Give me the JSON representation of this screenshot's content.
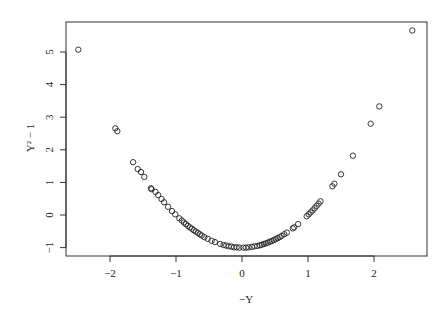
{
  "chart_data": {
    "type": "scatter",
    "title": "",
    "xlabel": "−Y",
    "ylabel": "Y² − 1",
    "xlim": [
      -2.65,
      2.8
    ],
    "ylim": [
      -1.25,
      5.95
    ],
    "xticks": [
      -2,
      -1,
      0,
      1,
      2
    ],
    "xtick_labels": [
      "−2",
      "−1",
      "0",
      "1",
      "2"
    ],
    "yticks": [
      -1,
      0,
      1,
      2,
      3,
      4,
      5
    ],
    "ytick_labels": [
      "−1",
      "0",
      "1",
      "2",
      "3",
      "4",
      "5"
    ],
    "grid": false,
    "legend": null,
    "marker": "open-circle",
    "points": [
      [
        -2.48,
        5.07
      ],
      [
        -1.92,
        2.66
      ],
      [
        -1.89,
        2.57
      ],
      [
        -1.65,
        1.62
      ],
      [
        -1.58,
        1.41
      ],
      [
        -1.53,
        1.32
      ],
      [
        -1.48,
        1.17
      ],
      [
        -1.38,
        0.82
      ],
      [
        -1.37,
        0.79
      ],
      [
        -1.31,
        0.71
      ],
      [
        -1.27,
        0.61
      ],
      [
        -1.22,
        0.49
      ],
      [
        -1.18,
        0.39
      ],
      [
        -1.12,
        0.25
      ],
      [
        -1.06,
        0.12
      ],
      [
        -1.01,
        0.02
      ],
      [
        -0.95,
        -0.1
      ],
      [
        -0.91,
        -0.17
      ],
      [
        -0.88,
        -0.23
      ],
      [
        -0.85,
        -0.28
      ],
      [
        -0.82,
        -0.33
      ],
      [
        -0.79,
        -0.38
      ],
      [
        -0.76,
        -0.42
      ],
      [
        -0.73,
        -0.47
      ],
      [
        -0.7,
        -0.51
      ],
      [
        -0.67,
        -0.55
      ],
      [
        -0.64,
        -0.59
      ],
      [
        -0.61,
        -0.63
      ],
      [
        -0.57,
        -0.68
      ],
      [
        -0.52,
        -0.73
      ],
      [
        -0.46,
        -0.79
      ],
      [
        -0.41,
        -0.83
      ],
      [
        -0.33,
        -0.89
      ],
      [
        -0.28,
        -0.92
      ],
      [
        -0.24,
        -0.94
      ],
      [
        -0.2,
        -0.96
      ],
      [
        -0.16,
        -0.97
      ],
      [
        -0.12,
        -0.99
      ],
      [
        -0.08,
        -0.99
      ],
      [
        -0.04,
        -1.0
      ],
      [
        0.02,
        -1.0
      ],
      [
        0.06,
        -1.0
      ],
      [
        0.1,
        -0.99
      ],
      [
        0.15,
        -0.98
      ],
      [
        0.19,
        -0.96
      ],
      [
        0.23,
        -0.95
      ],
      [
        0.27,
        -0.93
      ],
      [
        0.3,
        -0.91
      ],
      [
        0.33,
        -0.89
      ],
      [
        0.36,
        -0.87
      ],
      [
        0.39,
        -0.85
      ],
      [
        0.42,
        -0.82
      ],
      [
        0.45,
        -0.8
      ],
      [
        0.48,
        -0.77
      ],
      [
        0.51,
        -0.74
      ],
      [
        0.54,
        -0.71
      ],
      [
        0.57,
        -0.68
      ],
      [
        0.6,
        -0.64
      ],
      [
        0.64,
        -0.59
      ],
      [
        0.68,
        -0.54
      ],
      [
        0.77,
        -0.41
      ],
      [
        0.79,
        -0.38
      ],
      [
        0.85,
        -0.28
      ],
      [
        0.98,
        -0.04
      ],
      [
        1.01,
        0.02
      ],
      [
        1.04,
        0.08
      ],
      [
        1.07,
        0.14
      ],
      [
        1.1,
        0.21
      ],
      [
        1.13,
        0.28
      ],
      [
        1.16,
        0.35
      ],
      [
        1.19,
        0.42
      ],
      [
        1.37,
        0.88
      ],
      [
        1.4,
        0.96
      ],
      [
        1.5,
        1.25
      ],
      [
        1.68,
        1.82
      ],
      [
        1.95,
        2.8
      ],
      [
        2.08,
        3.33
      ],
      [
        2.58,
        5.66
      ]
    ]
  }
}
